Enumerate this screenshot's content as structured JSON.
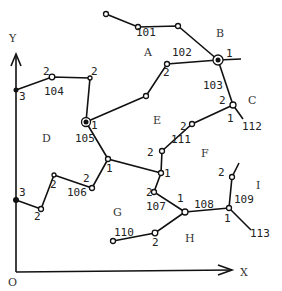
{
  "axes": {
    "x_label": "X",
    "y_label": "Y",
    "origin_label": "O"
  },
  "regions": [
    "A",
    "B",
    "C",
    "D",
    "E",
    "F",
    "G",
    "H",
    "I"
  ],
  "edge_labels": [
    "101",
    "102",
    "103",
    "104",
    "105",
    "106",
    "107",
    "108",
    "109",
    "110",
    "111",
    "112",
    "113"
  ],
  "node_numbers": {
    "n_b_hub": "1",
    "n_102_left": "2",
    "n_103_bottom": "2",
    "n_c_right": "1",
    "n_104_left": "2",
    "n_104_right": "2",
    "n_y3_top": "3",
    "n_105": "1",
    "n_111_top": "2",
    "n_111_bottom": "2",
    "n_mid_1": "1",
    "n_mid_1b": "1",
    "n_106_a": "2",
    "n_106_b": "2",
    "n_106_c": "2",
    "n_y3_bottom": "3",
    "n_107": "2",
    "n_108_left": "1",
    "n_108_right": "1",
    "n_109_top": "2",
    "n_110": "2"
  }
}
